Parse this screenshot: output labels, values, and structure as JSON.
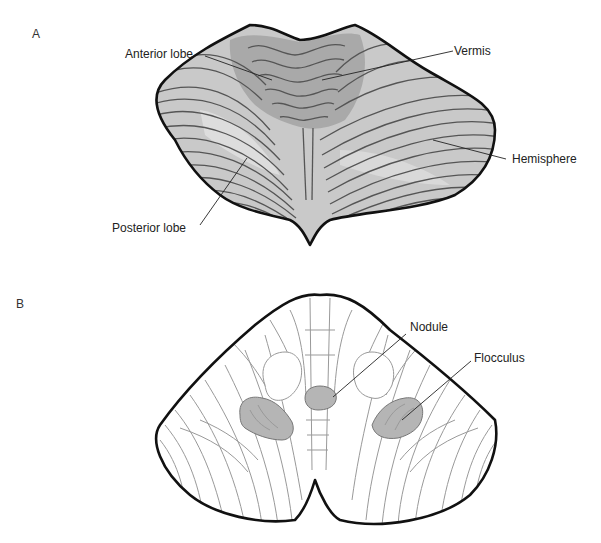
{
  "figure": {
    "panels": [
      {
        "id": "A",
        "label": "A",
        "view": "superior",
        "annotations": [
          {
            "key": "anterior",
            "text": "Anterior lobe"
          },
          {
            "key": "vermis",
            "text": "Vermis"
          },
          {
            "key": "hemisphere",
            "text": "Hemisphere"
          },
          {
            "key": "posterior",
            "text": "Posterior lobe"
          }
        ]
      },
      {
        "id": "B",
        "label": "B",
        "view": "inferior",
        "annotations": [
          {
            "key": "nodule",
            "text": "Nodule"
          },
          {
            "key": "flocculus",
            "text": "Flocculus"
          }
        ]
      }
    ],
    "colors": {
      "panel_a_fill": "#c9c9c9",
      "panel_a_vermis": "#a9a9a9",
      "panel_b_fill": "#ffffff",
      "highlight": "#b5b5b5",
      "outline": "#111111"
    }
  }
}
